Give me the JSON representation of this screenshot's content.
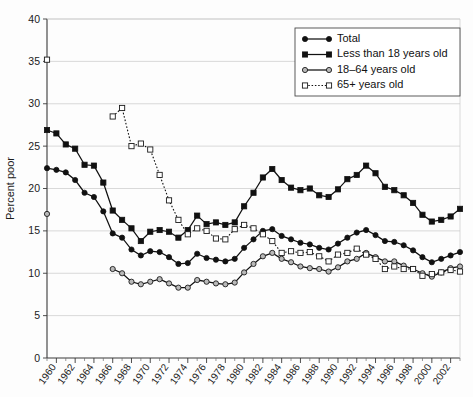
{
  "chart_data": {
    "type": "line",
    "title": "",
    "xlabel": "",
    "ylabel": "Percent poor",
    "ylim": [
      0,
      40
    ],
    "xlim": [
      1959,
      2003
    ],
    "ytick_values": [
      0,
      5,
      10,
      15,
      20,
      25,
      30,
      35,
      40
    ],
    "ytick_labels": [
      "0",
      "5",
      "10",
      "15",
      "20",
      "25",
      "30",
      "35",
      "40"
    ],
    "xtick_labels": [
      "1960",
      "1962",
      "1964",
      "1966",
      "1968",
      "1970",
      "1972",
      "1974",
      "1976",
      "1978",
      "1980",
      "1982",
      "1984",
      "1986",
      "1988",
      "1990",
      "1992",
      "1994",
      "1996",
      "1998",
      "2000",
      "2002"
    ],
    "xtick_values": [
      1960,
      1962,
      1964,
      1966,
      1968,
      1970,
      1972,
      1974,
      1976,
      1978,
      1980,
      1982,
      1984,
      1986,
      1988,
      1990,
      1992,
      1994,
      1996,
      1998,
      2000,
      2002
    ],
    "grid": "horizontal",
    "legend_position": "top-right",
    "years": [
      1959,
      1960,
      1961,
      1962,
      1963,
      1964,
      1965,
      1966,
      1967,
      1968,
      1969,
      1970,
      1971,
      1972,
      1973,
      1974,
      1975,
      1976,
      1977,
      1978,
      1979,
      1980,
      1981,
      1982,
      1983,
      1984,
      1985,
      1986,
      1987,
      1988,
      1989,
      1990,
      1991,
      1992,
      1993,
      1994,
      1995,
      1996,
      1997,
      1998,
      1999,
      2000,
      2001,
      2002,
      2003
    ],
    "series": [
      {
        "name": "Total",
        "marker": "filled-circle",
        "linestyle": "solid",
        "x": [
          1959,
          1960,
          1961,
          1962,
          1963,
          1964,
          1965,
          1966,
          1967,
          1968,
          1969,
          1970,
          1971,
          1972,
          1973,
          1974,
          1975,
          1976,
          1977,
          1978,
          1979,
          1980,
          1981,
          1982,
          1983,
          1984,
          1985,
          1986,
          1987,
          1988,
          1989,
          1990,
          1991,
          1992,
          1993,
          1994,
          1995,
          1996,
          1997,
          1998,
          1999,
          2000,
          2001,
          2002,
          2003
        ],
        "values": [
          22.4,
          22.2,
          21.9,
          21.0,
          19.5,
          19.0,
          17.3,
          14.7,
          14.2,
          12.8,
          12.1,
          12.6,
          12.5,
          11.9,
          11.1,
          11.2,
          12.3,
          11.8,
          11.6,
          11.4,
          11.7,
          13.0,
          14.0,
          15.0,
          15.2,
          14.4,
          14.0,
          13.6,
          13.4,
          13.0,
          12.8,
          13.5,
          14.2,
          14.8,
          15.1,
          14.5,
          13.8,
          13.7,
          13.3,
          12.7,
          11.9,
          11.3,
          11.7,
          12.1,
          12.5
        ]
      },
      {
        "name": "Less than 18 years old",
        "marker": "filled-square",
        "linestyle": "solid",
        "x": [
          1959,
          1960,
          1961,
          1962,
          1963,
          1964,
          1965,
          1966,
          1967,
          1968,
          1969,
          1970,
          1971,
          1972,
          1973,
          1974,
          1975,
          1976,
          1977,
          1978,
          1979,
          1980,
          1981,
          1982,
          1983,
          1984,
          1985,
          1986,
          1987,
          1988,
          1989,
          1990,
          1991,
          1992,
          1993,
          1994,
          1995,
          1996,
          1997,
          1998,
          1999,
          2000,
          2001,
          2002,
          2003
        ],
        "values": [
          26.9,
          26.5,
          25.2,
          24.7,
          22.8,
          22.7,
          20.7,
          17.4,
          16.3,
          15.3,
          13.8,
          14.9,
          15.1,
          14.9,
          14.2,
          15.1,
          16.8,
          15.8,
          16.0,
          15.7,
          16.0,
          17.9,
          19.5,
          21.3,
          22.3,
          21.0,
          20.1,
          19.8,
          20.0,
          19.2,
          19.0,
          19.9,
          21.1,
          21.6,
          22.7,
          21.8,
          20.2,
          19.8,
          19.2,
          18.3,
          16.9,
          16.1,
          16.3,
          16.7,
          17.6
        ]
      },
      {
        "name": "18–64 years old",
        "marker": "open-circle",
        "linestyle": "solid",
        "x": [
          1959,
          1966,
          1967,
          1968,
          1969,
          1970,
          1971,
          1972,
          1973,
          1974,
          1975,
          1976,
          1977,
          1978,
          1979,
          1980,
          1981,
          1982,
          1983,
          1984,
          1985,
          1986,
          1987,
          1988,
          1989,
          1990,
          1991,
          1992,
          1993,
          1994,
          1995,
          1996,
          1997,
          1998,
          1999,
          2000,
          2001,
          2002,
          2003
        ],
        "values": [
          17.0,
          10.5,
          10.0,
          9.0,
          8.7,
          9.0,
          9.3,
          8.8,
          8.3,
          8.3,
          9.2,
          9.0,
          8.8,
          8.7,
          8.9,
          10.1,
          11.1,
          12.0,
          12.4,
          11.7,
          11.3,
          10.8,
          10.6,
          10.5,
          10.2,
          10.7,
          11.4,
          11.7,
          12.4,
          11.9,
          11.4,
          11.4,
          10.9,
          10.5,
          10.0,
          9.6,
          10.1,
          10.6,
          10.8
        ]
      },
      {
        "name": "65+ years old",
        "marker": "open-square",
        "linestyle": "dotted",
        "x": [
          1959,
          1966,
          1967,
          1968,
          1969,
          1970,
          1971,
          1972,
          1973,
          1974,
          1975,
          1976,
          1977,
          1978,
          1979,
          1980,
          1981,
          1982,
          1983,
          1984,
          1985,
          1986,
          1987,
          1988,
          1989,
          1990,
          1991,
          1992,
          1993,
          1994,
          1995,
          1996,
          1997,
          1998,
          1999,
          2000,
          2001,
          2002,
          2003
        ],
        "values": [
          35.2,
          28.5,
          29.5,
          25.0,
          25.3,
          24.6,
          21.6,
          18.6,
          16.3,
          14.6,
          15.3,
          15.0,
          14.1,
          14.0,
          15.2,
          15.7,
          15.3,
          14.6,
          13.8,
          12.4,
          12.6,
          12.4,
          12.5,
          12.0,
          11.4,
          12.2,
          12.4,
          12.9,
          12.2,
          11.7,
          10.5,
          10.8,
          10.5,
          10.5,
          9.7,
          9.9,
          10.1,
          10.4,
          10.2
        ]
      }
    ]
  },
  "legend": {
    "entries": [
      {
        "label": "Total"
      },
      {
        "label": "Less than 18 years old"
      },
      {
        "label": "18–64 years old"
      },
      {
        "label": "65+ years old"
      }
    ]
  }
}
